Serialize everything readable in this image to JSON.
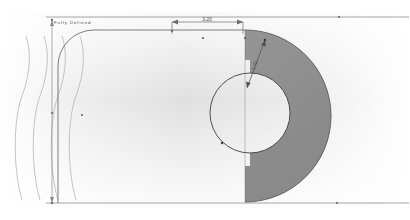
{
  "document": {
    "type": "cad-technical-drawing",
    "title": "Sketch profile with revolved crescent section",
    "background_color": "#ffffff",
    "paper_tint": "#f2f2f2"
  },
  "canvas": {
    "width": 410,
    "height": 220
  },
  "colors": {
    "line": "#5a5a5a",
    "thin_line": "#9a9a9a",
    "dimension_line": "#6b6b6b",
    "shaded_fill": "#8e8e8e",
    "shaded_stroke": "#4a4a4a",
    "construction": "#b5b5b5",
    "wave_curve": "#a8a8a8",
    "gradient_start": "#d9d9d9",
    "gradient_end": "#ffffff"
  },
  "annotations": {
    "top_dimension": {
      "name": "horizontal-linear-dimension",
      "value": "3.20",
      "x_start": 172,
      "x_end": 243,
      "y": 22
    },
    "diagonal_dimension": {
      "name": "radial-dimension",
      "value": "1.00",
      "rotation": -64
    },
    "vertical_dimension": {
      "name": "vertical-linear-dimension",
      "value": "",
      "x": 52,
      "y_start": 20,
      "y_end": 203
    },
    "corner_label": {
      "name": "sketch-status-label",
      "value": "Fully Defined"
    }
  },
  "geometry": {
    "profile": {
      "name": "rounded-rectangle-profile",
      "left": 58,
      "top": 28,
      "right": 245,
      "bottom": 203,
      "corner_radius": 36
    },
    "outer_arc": {
      "name": "outer-revolve-arc",
      "cx": 245,
      "cy": 116,
      "r": 86,
      "start_deg": -90,
      "end_deg": 90
    },
    "inner_arc": {
      "name": "inner-cut-arc",
      "cx": 250,
      "cy": 113,
      "r": 40
    },
    "centerline_x": 245,
    "top_rule_y": 17,
    "bottom_rule_y": 203,
    "waves": {
      "name": "sine-wave-construction-curves",
      "count": 4,
      "x_positions": [
        22,
        40,
        58,
        76
      ],
      "amplitude": 9,
      "cycles": 1,
      "y_top": 36,
      "y_bottom": 200
    }
  },
  "points": [
    {
      "name": "endpoint",
      "x": 172,
      "y": 31
    },
    {
      "name": "endpoint",
      "x": 203,
      "y": 38
    },
    {
      "name": "endpoint",
      "x": 245,
      "y": 38
    },
    {
      "name": "endpoint",
      "x": 265,
      "y": 40
    },
    {
      "name": "endpoint",
      "x": 52,
      "y": 113
    },
    {
      "name": "endpoint",
      "x": 82,
      "y": 115
    },
    {
      "name": "endpoint",
      "x": 339,
      "y": 17
    },
    {
      "name": "endpoint",
      "x": 337,
      "y": 203
    }
  ]
}
